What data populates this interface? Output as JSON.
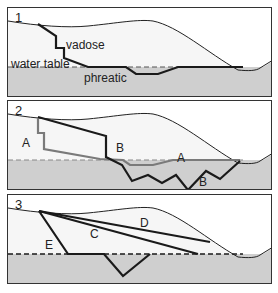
{
  "figure": {
    "colors": {
      "ground_fill": "#cfcfcf",
      "vadose_fill": "#f6f6f6",
      "outline": "#222222",
      "path_dark": "#1a1a1a",
      "path_gray": "#7a7a7a",
      "frame": "#333333"
    },
    "panels": [
      {
        "number": "1",
        "labels": {
          "vadose": "vadose",
          "water_table": "water table",
          "phreatic": "phreatic"
        }
      },
      {
        "number": "2",
        "labels": {
          "a_left": "A",
          "b_upper": "B",
          "a_right": "A",
          "b_lower": "B"
        }
      },
      {
        "number": "3",
        "labels": {
          "e": "E",
          "c": "C",
          "d": "D"
        }
      }
    ]
  }
}
